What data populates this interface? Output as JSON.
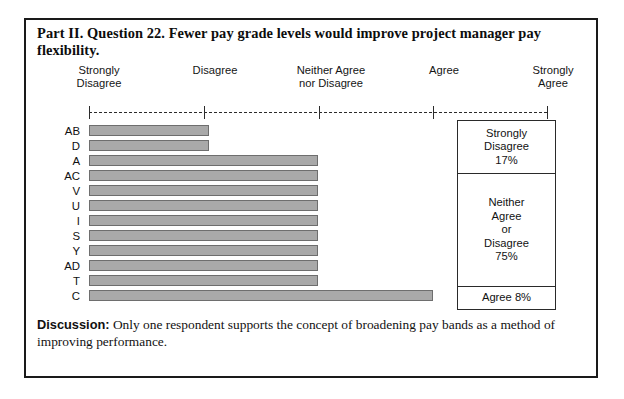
{
  "figure": {
    "title": "Part II. Question 22. Fewer pay grade levels would improve project manager pay flexibility."
  },
  "scale": {
    "labels": [
      "Strongly\nDisagree",
      "Disagree",
      "Neither Agree\nnor Disagree",
      "Agree",
      "Strongly\nAgree"
    ],
    "tick_positions_px": [
      87,
      202,
      317,
      431,
      545
    ]
  },
  "legend": {
    "sections": [
      "Strongly\nDisagree\n17%",
      "Neither\nAgree\nor\nDisagree\n75%",
      "Agree 8%"
    ]
  },
  "discussion": {
    "label": "Discussion:",
    "text": " Only one respondent supports the concept of broadening pay bands as a method of improving performance."
  },
  "chart_data": {
    "type": "bar",
    "title": "Part II. Question 22. Fewer pay grade levels would improve project manager pay flexibility.",
    "orientation": "horizontal",
    "xlabel": "",
    "ylabel": "",
    "grid": false,
    "legend_position": "right",
    "x_tick_labels": [
      "Strongly Disagree",
      "Disagree",
      "Neither Agree nor Disagree",
      "Agree",
      "Strongly Agree"
    ],
    "xlim": [
      1,
      5
    ],
    "categories": [
      "AB",
      "D",
      "A",
      "AC",
      "V",
      "U",
      "I",
      "S",
      "Y",
      "AD",
      "T",
      "C"
    ],
    "values": [
      2.05,
      2.05,
      3.0,
      3.0,
      3.0,
      3.0,
      3.0,
      3.0,
      3.0,
      3.0,
      3.0,
      4.0
    ],
    "annotations": [
      "Strongly Disagree 17%",
      "Neither Agree or Disagree 75%",
      "Agree 8%"
    ],
    "bar_color": "#a9a9a9",
    "bar_border_color": "#6e6e6e"
  }
}
